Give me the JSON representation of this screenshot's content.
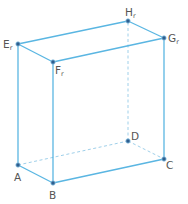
{
  "figure": {
    "type": "rectangular prism (cuboid) wireframe",
    "colors": {
      "edge": "#5ab6e2",
      "hidden_edge": "#9fd0ea",
      "vertex": "#2d5f8f",
      "label": "#555555"
    },
    "vertices": {
      "A": {
        "label": "A",
        "sub": ""
      },
      "B": {
        "label": "B",
        "sub": ""
      },
      "C": {
        "label": "C",
        "sub": ""
      },
      "D": {
        "label": "D",
        "sub": ""
      },
      "E": {
        "label": "E",
        "sub": "r"
      },
      "F": {
        "label": "F",
        "sub": "r"
      },
      "G": {
        "label": "G",
        "sub": "r"
      },
      "H": {
        "label": "H",
        "sub": "r"
      }
    },
    "visible_edges": [
      "AB",
      "BC",
      "AE",
      "BF",
      "CG",
      "EF",
      "FG",
      "GH",
      "HE"
    ],
    "hidden_edges": [
      "AD",
      "DC",
      "DH"
    ]
  }
}
